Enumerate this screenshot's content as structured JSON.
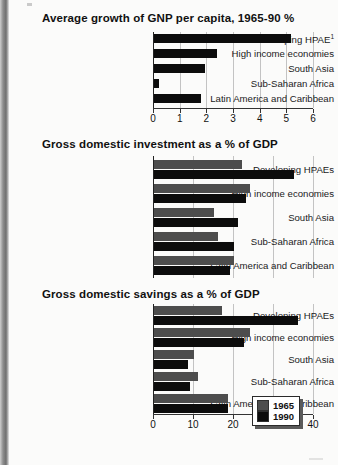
{
  "document": {
    "kind": "scanned-figure-page",
    "panel_count": 3
  },
  "legend": {
    "entries": [
      {
        "label": "1965",
        "color": "#4d4d4d",
        "swatch": "gray-square-icon"
      },
      {
        "label": "1990",
        "color": "#0c0c0c",
        "swatch": "black-square-icon"
      }
    ]
  },
  "footnote_marker": "1",
  "chart_data": [
    {
      "type": "bar",
      "orientation": "horizontal",
      "title": "Average growth of GNP per capita, 1965-90 %",
      "xlabel": "",
      "ylabel": "",
      "categories": [
        "Developing HPAE",
        "High income economies",
        "South Asia",
        "Sub-Saharan Africa",
        "Latin America and Caribbean"
      ],
      "category_superscripts": [
        "1",
        "",
        "",
        "",
        ""
      ],
      "series": [
        {
          "name": "",
          "color": "#0c0c0c",
          "values": [
            5.15,
            2.35,
            1.9,
            0.2,
            1.75
          ]
        }
      ],
      "xlim": [
        0,
        6
      ],
      "xticks": [
        0,
        1,
        2,
        3,
        4,
        5,
        6
      ],
      "xticklabels": [
        "0",
        "1",
        "2",
        "3",
        "4",
        "5",
        "6"
      ],
      "grid": true,
      "legend_position": "none"
    },
    {
      "type": "bar",
      "orientation": "horizontal",
      "title": "Gross domestic investment as a % of GDP",
      "xlabel": "",
      "ylabel": "",
      "categories": [
        "Developing HPAEs",
        "High income economies",
        "South Asia",
        "Sub-Saharan Africa",
        "Latin America and Caribbean"
      ],
      "series": [
        {
          "name": "1965",
          "color": "#4d4d4d",
          "values": [
            22,
            24,
            15,
            16,
            20
          ]
        },
        {
          "name": "1990",
          "color": "#0c0c0c",
          "values": [
            35,
            23,
            21,
            20,
            19
          ]
        }
      ],
      "xlim": [
        0,
        40
      ],
      "xticks": [
        0,
        10,
        20,
        30,
        40
      ],
      "xticklabels": [
        "",
        "",
        "",
        "",
        ""
      ],
      "grid": true,
      "legend_position": "none"
    },
    {
      "type": "bar",
      "orientation": "horizontal",
      "title": "Gross domestic savings as a % of GDP",
      "xlabel": "",
      "ylabel": "",
      "categories": [
        "Developing HPAEs",
        "High income economies",
        "South Asia",
        "Sub-Saharan Africa",
        "Latin America and Caribbean"
      ],
      "series": [
        {
          "name": "1965",
          "color": "#4d4d4d",
          "values": [
            17,
            24,
            10,
            11,
            18.5
          ]
        },
        {
          "name": "1990",
          "color": "#0c0c0c",
          "values": [
            36,
            22.5,
            8.5,
            9,
            18.5
          ]
        }
      ],
      "xlim": [
        0,
        40
      ],
      "xticks": [
        0,
        10,
        20,
        30,
        40
      ],
      "xticklabels": [
        "0",
        "10",
        "20",
        "30",
        "40"
      ],
      "grid": true,
      "legend_position": "inside-bottom-right"
    }
  ]
}
